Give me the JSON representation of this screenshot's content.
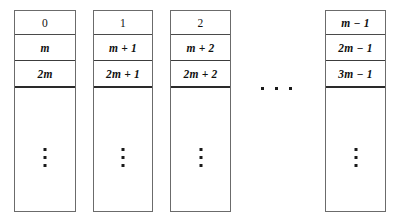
{
  "figure": {
    "background_color": "#ffffff",
    "border_color": "#6b6b6b",
    "text_color": "#111111",
    "dot_color": "#1a1a1a"
  },
  "columns": [
    {
      "name": "bucket-0",
      "left": 14,
      "top": 10,
      "width": 62,
      "height": 202,
      "cells": [
        {
          "text": "0",
          "label": "0"
        },
        {
          "text": "m",
          "label": "m"
        },
        {
          "text": "2m",
          "label": "2m"
        }
      ],
      "vertical_ellipsis": "⋮"
    },
    {
      "name": "bucket-1",
      "left": 93,
      "top": 10,
      "width": 60,
      "height": 202,
      "cells": [
        {
          "text": "1",
          "label": "1"
        },
        {
          "text": "m + 1",
          "label": "m + 1"
        },
        {
          "text": "2m + 1",
          "label": "2m + 1"
        }
      ],
      "vertical_ellipsis": "⋮"
    },
    {
      "name": "bucket-2",
      "left": 170,
      "top": 10,
      "width": 61,
      "height": 202,
      "cells": [
        {
          "text": "2",
          "label": "2"
        },
        {
          "text": "m + 2",
          "label": "m + 2"
        },
        {
          "text": "2m + 2",
          "label": "2m + 2"
        }
      ],
      "vertical_ellipsis": "⋮"
    },
    {
      "name": "bucket-m-minus-1",
      "left": 325,
      "top": 10,
      "width": 61,
      "height": 202,
      "cells": [
        {
          "text": "m - 1",
          "label": "m − 1"
        },
        {
          "text": "2m - 1",
          "label": "2m − 1"
        },
        {
          "text": "3m - 1",
          "label": "3m − 1"
        }
      ],
      "vertical_ellipsis": "⋮"
    }
  ],
  "horizontal_ellipsis": {
    "name": "columns-continuation-ellipsis",
    "symbol": "⋯",
    "dot_count": 3
  }
}
